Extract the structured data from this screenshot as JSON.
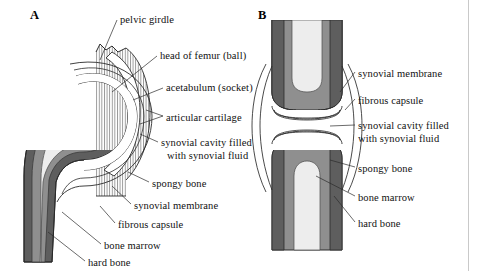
{
  "figure": {
    "background": "#ffffff",
    "border_color": "#c9c9c9"
  },
  "panels": [
    {
      "id": "A",
      "letter": "A",
      "subject": "hip joint (ball-and-socket) cross-section"
    },
    {
      "id": "B",
      "letter": "B",
      "subject": "generic synovial joint cross-section"
    }
  ],
  "colors": {
    "hard_bone": "#5e5e5e",
    "spongy_bone": "#8f8f8f",
    "bone_marrow": "#ededed",
    "cartilage": "#ffffff",
    "cavity": "#ffffff",
    "outline": "#2b2b2b",
    "hatch": "#777777",
    "stipple": "#b9b9b9"
  },
  "labels_panel_a": [
    {
      "id": "pelvic-girdle",
      "text": "pelvic girdle",
      "x": 120,
      "y": 14
    },
    {
      "id": "head-of-femur",
      "text": "head of femur (ball)",
      "x": 160,
      "y": 50
    },
    {
      "id": "acetabulum",
      "text": "acetabulum (socket)",
      "x": 166,
      "y": 82
    },
    {
      "id": "articular-cartilage",
      "text": "articular cartilage",
      "x": 166,
      "y": 112
    },
    {
      "id": "synovial-cavity",
      "text": "synovial cavity filled",
      "x": 161,
      "y": 137
    },
    {
      "id": "synovial-cavity-2",
      "text": "with synovial fluid",
      "x": 167,
      "y": 150
    },
    {
      "id": "spongy-bone",
      "text": "spongy bone",
      "x": 152,
      "y": 178
    },
    {
      "id": "synovial-membrane",
      "text": "synovial membrane",
      "x": 134,
      "y": 200
    },
    {
      "id": "fibrous-capsule",
      "text": "fibrous capsule",
      "x": 118,
      "y": 219
    },
    {
      "id": "bone-marrow",
      "text": "bone marrow",
      "x": 104,
      "y": 240
    },
    {
      "id": "hard-bone",
      "text": "hard bone",
      "x": 88,
      "y": 257
    }
  ],
  "labels_panel_b": [
    {
      "id": "synovial-membrane-b",
      "text": "synovial membrane",
      "x": 358,
      "y": 68
    },
    {
      "id": "fibrous-capsule-b",
      "text": "fibrous capsule",
      "x": 358,
      "y": 95
    },
    {
      "id": "synovial-cavity-b",
      "text": "synovial cavity filled",
      "x": 358,
      "y": 120
    },
    {
      "id": "synovial-cavity-b2",
      "text": "with synovial fluid",
      "x": 358,
      "y": 133
    },
    {
      "id": "spongy-bone-b",
      "text": "spongy bone",
      "x": 358,
      "y": 163
    },
    {
      "id": "bone-marrow-b",
      "text": "bone marrow",
      "x": 358,
      "y": 192
    },
    {
      "id": "hard-bone-b",
      "text": "hard bone",
      "x": 358,
      "y": 218
    }
  ],
  "panel_letter_positions": {
    "a": {
      "x": 30,
      "y": 8
    },
    "b": {
      "x": 258,
      "y": 8
    }
  }
}
